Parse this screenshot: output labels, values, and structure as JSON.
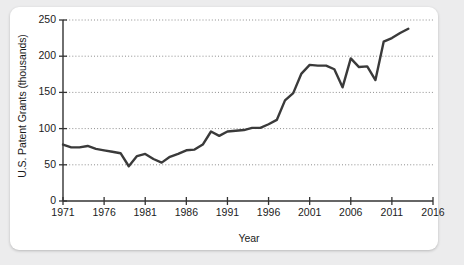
{
  "chart_data": {
    "type": "line",
    "title": "",
    "xlabel": "Year",
    "ylabel": "U.S. Patent Grants (thousands)",
    "xlim": [
      1971,
      2016
    ],
    "ylim": [
      0,
      250
    ],
    "xticks": [
      1971,
      1976,
      1981,
      1986,
      1991,
      1996,
      2001,
      2006,
      2011,
      2016
    ],
    "yticks": [
      0,
      50,
      100,
      150,
      200,
      250
    ],
    "grid": "horizontal-dotted",
    "legend": "none",
    "line_color": "#3a3a3a",
    "x": [
      1971,
      1972,
      1973,
      1974,
      1975,
      1976,
      1977,
      1978,
      1979,
      1980,
      1981,
      1982,
      1983,
      1984,
      1985,
      1986,
      1987,
      1988,
      1989,
      1990,
      1991,
      1992,
      1993,
      1994,
      1995,
      1996,
      1997,
      1998,
      1999,
      2000,
      2001,
      2002,
      2003,
      2004,
      2005,
      2006,
      2007,
      2008,
      2009,
      2010,
      2011,
      2012,
      2013
    ],
    "values": [
      78,
      74,
      74,
      76,
      72,
      70,
      68,
      66,
      48,
      62,
      65,
      58,
      53,
      61,
      65,
      70,
      71,
      78,
      96,
      90,
      96,
      97,
      98,
      101,
      101,
      106,
      112,
      139,
      149,
      176,
      188,
      187,
      187,
      182,
      157,
      197,
      185,
      186,
      167,
      220,
      225,
      232,
      238
    ]
  },
  "axis": {
    "x_tick_labels": [
      "1971",
      "1976",
      "1981",
      "1986",
      "1991",
      "1996",
      "2001",
      "2006",
      "2011",
      "2016"
    ],
    "y_tick_labels": [
      "0",
      "50",
      "100",
      "150",
      "200",
      "250"
    ],
    "x_title": "Year",
    "y_title": "U.S. Patent Grants (thousands)"
  }
}
